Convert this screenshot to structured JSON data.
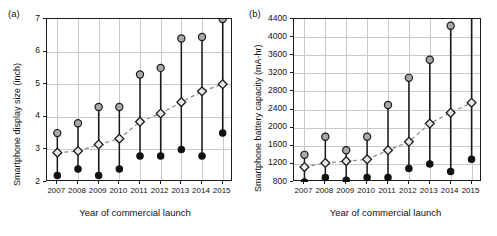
{
  "figure": {
    "panels": [
      "a",
      "b"
    ],
    "shared_xlabel": "Year of commercial launch"
  },
  "panel_a": {
    "label": "(a)",
    "ylabel": "Smartphone display size (inch)",
    "xlabel": "Year of commercial launch"
  },
  "panel_b": {
    "label": "(b)",
    "ylabel": "Smartphone battery capacity (mA-hr)",
    "xlabel": "Year of commercial launch"
  },
  "chart_data": [
    {
      "type": "scatter",
      "panel": "a",
      "title": "Smartphone display size by year of commercial launch",
      "xlabel": "Year of commercial launch",
      "ylabel": "Smartphone display size (inch)",
      "x": [
        2007,
        2008,
        2009,
        2010,
        2011,
        2012,
        2013,
        2014,
        2015
      ],
      "categories": [
        "2007",
        "2008",
        "2009",
        "2010",
        "2011",
        "2012",
        "2013",
        "2014",
        "2015"
      ],
      "xticklabels": [
        "2007",
        "2008",
        "2009",
        "2010",
        "2011",
        "2012",
        "2013",
        "2014",
        "2015"
      ],
      "yticks": [
        2,
        3,
        4,
        5,
        6,
        7
      ],
      "yticklabels": [
        "2",
        "3",
        "4",
        "5",
        "6",
        "7"
      ],
      "ylim": [
        2,
        7
      ],
      "xlim": [
        2006.5,
        2015.5
      ],
      "grid": true,
      "legend": null,
      "series": [
        {
          "name": "Maximum display size",
          "marker": "circle-gray",
          "values": [
            3.5,
            3.8,
            4.3,
            4.3,
            5.3,
            5.5,
            6.4,
            6.45,
            7.0
          ]
        },
        {
          "name": "Average display size",
          "marker": "diamond-open",
          "values": [
            2.9,
            2.95,
            3.15,
            3.33,
            3.85,
            4.1,
            4.45,
            4.78,
            5.0
          ]
        },
        {
          "name": "Minimum display size",
          "marker": "circle-black",
          "values": [
            2.2,
            2.4,
            2.2,
            2.4,
            2.8,
            2.8,
            3.0,
            2.8,
            3.5
          ]
        }
      ],
      "trend_series": "Average display size",
      "units": "inch"
    },
    {
      "type": "scatter",
      "panel": "b",
      "title": "Smartphone battery capacity by year of commercial launch",
      "xlabel": "Year of commercial launch",
      "ylabel": "Smartphone battery capacity (mA-hr)",
      "x": [
        2007,
        2008,
        2009,
        2010,
        2011,
        2012,
        2013,
        2014,
        2015
      ],
      "categories": [
        "2007",
        "2008",
        "2009",
        "2010",
        "2011",
        "2012",
        "2013",
        "2014",
        "2015"
      ],
      "xticklabels": [
        "2007",
        "2008",
        "2009",
        "2010",
        "2011",
        "2012",
        "2013",
        "2014",
        "2015"
      ],
      "yticks": [
        800,
        1200,
        1600,
        2000,
        2400,
        2800,
        3200,
        3600,
        4000,
        4400
      ],
      "yticklabels": [
        "800",
        "1200",
        "1600",
        "2000",
        "2400",
        "2800",
        "3200",
        "3600",
        "4000",
        "4400"
      ],
      "ylim": [
        800,
        4400
      ],
      "xlim": [
        2006.5,
        2015.5
      ],
      "grid": true,
      "legend": null,
      "series": [
        {
          "name": "Maximum battery capacity",
          "marker": "circle-gray",
          "values": [
            1400,
            1800,
            1500,
            1800,
            2500,
            3100,
            3500,
            4250,
            4600
          ]
        },
        {
          "name": "Average battery capacity",
          "marker": "diamond-open",
          "values": [
            1130,
            1220,
            1260,
            1300,
            1500,
            1690,
            2090,
            2330,
            2550
          ]
        },
        {
          "name": "Minimum battery capacity",
          "marker": "circle-black",
          "values": [
            800,
            900,
            840,
            900,
            900,
            1100,
            1200,
            1030,
            1300
          ]
        }
      ],
      "trend_series": "Average battery capacity",
      "units": "mA-hr",
      "notes": "The 2015 maximum marker extends above the plotted axis range and is clipped."
    }
  ]
}
